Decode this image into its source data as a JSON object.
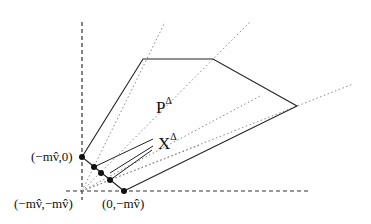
{
  "diagram": {
    "type": "polytope-figure",
    "colors": {
      "ink": "#222222",
      "dotted": "#888888",
      "background": "#ffffff"
    },
    "labels": {
      "P": "P",
      "P_sup": "Δ",
      "X": "X",
      "X_sup": "Δ",
      "point_a": "(−mv̂,0)",
      "point_origin": "(−mv̂,−mv̂)",
      "point_b": "(0,−mv̂)"
    },
    "axes": {
      "vertical": {
        "x": 82,
        "y1": 22,
        "y2": 200
      },
      "horizontal": {
        "y": 191,
        "x1": 66,
        "x2": 308
      }
    },
    "polygon_P": [
      [
        82,
        157
      ],
      [
        143,
        59
      ],
      [
        213,
        59
      ],
      [
        297,
        106
      ],
      [
        124,
        191
      ]
    ],
    "polygon_X_edges": [
      [
        [
          94,
          167
        ],
        [
          160,
          135
        ]
      ],
      [
        [
          110,
          180
        ],
        [
          175,
          150
        ]
      ]
    ],
    "dots": [
      [
        82,
        157
      ],
      [
        94,
        167
      ],
      [
        101,
        173
      ],
      [
        110,
        180
      ],
      [
        124,
        191
      ]
    ],
    "dotted_rays": [
      [
        [
          82,
          191
        ],
        [
          165,
          22
        ]
      ],
      [
        [
          82,
          191
        ],
        [
          250,
          22
        ]
      ],
      [
        [
          82,
          191
        ],
        [
          353,
          84
        ]
      ],
      [
        [
          82,
          191
        ],
        [
          260,
          100
        ]
      ],
      [
        [
          82,
          191
        ],
        [
          190,
          150
        ]
      ]
    ]
  }
}
